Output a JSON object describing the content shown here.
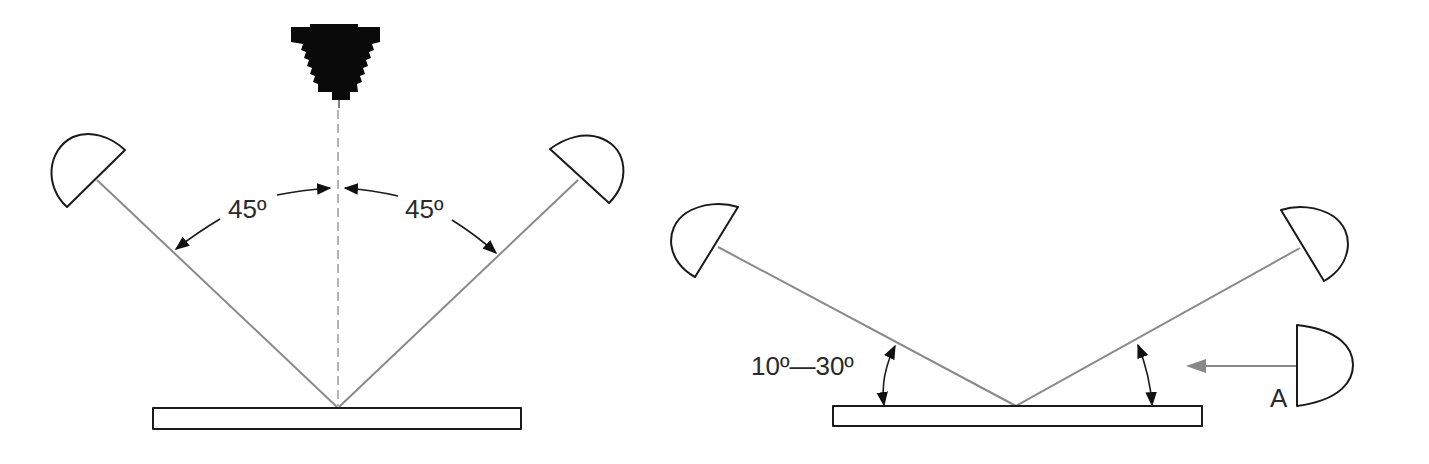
{
  "diagram": {
    "left_panel": {
      "title": "",
      "angle_left_label": "45º",
      "angle_right_label": "45º",
      "elements": [
        "camera",
        "light-left",
        "light-right",
        "copy-board",
        "optical-axis"
      ]
    },
    "right_panel": {
      "title": "",
      "angle_label": "10º—30º",
      "light_a_label": "A",
      "elements": [
        "light-left",
        "light-right",
        "light-a",
        "copy-board"
      ]
    },
    "colors": {
      "outline": "#1a1a1a",
      "beam": "#8a8a8a",
      "arrow_gray": "#888888",
      "background": "#ffffff"
    }
  }
}
